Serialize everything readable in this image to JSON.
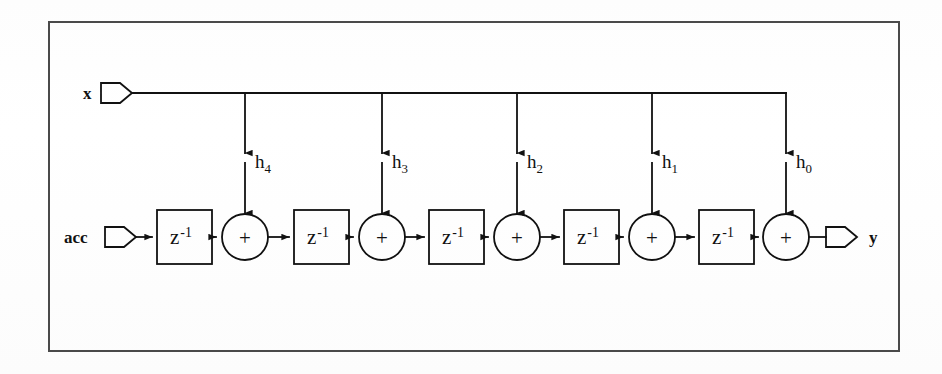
{
  "figure": {
    "kind": "block-diagram",
    "border_color": "#4a4a4a",
    "line_color": "#111111",
    "background": "#fefefe"
  },
  "ports": [
    {
      "id": "x",
      "label": "x",
      "direction": "input",
      "side": "left-top"
    },
    {
      "id": "acc",
      "label": "acc",
      "direction": "input",
      "side": "left-bottom"
    },
    {
      "id": "y",
      "label": "y",
      "direction": "output",
      "side": "right-bottom"
    }
  ],
  "coefficients": [
    {
      "base": "h",
      "sub": "4"
    },
    {
      "base": "h",
      "sub": "3"
    },
    {
      "base": "h",
      "sub": "2"
    },
    {
      "base": "h",
      "sub": "1"
    },
    {
      "base": "h",
      "sub": "0"
    }
  ],
  "delay_blocks": [
    {
      "base": "z",
      "exp": "-1"
    },
    {
      "base": "z",
      "exp": "-1"
    },
    {
      "base": "z",
      "exp": "-1"
    },
    {
      "base": "z",
      "exp": "-1"
    },
    {
      "base": "z",
      "exp": "-1"
    }
  ],
  "adders": [
    {
      "symbol": "+"
    },
    {
      "symbol": "+"
    },
    {
      "symbol": "+"
    },
    {
      "symbol": "+"
    },
    {
      "symbol": "+"
    }
  ]
}
